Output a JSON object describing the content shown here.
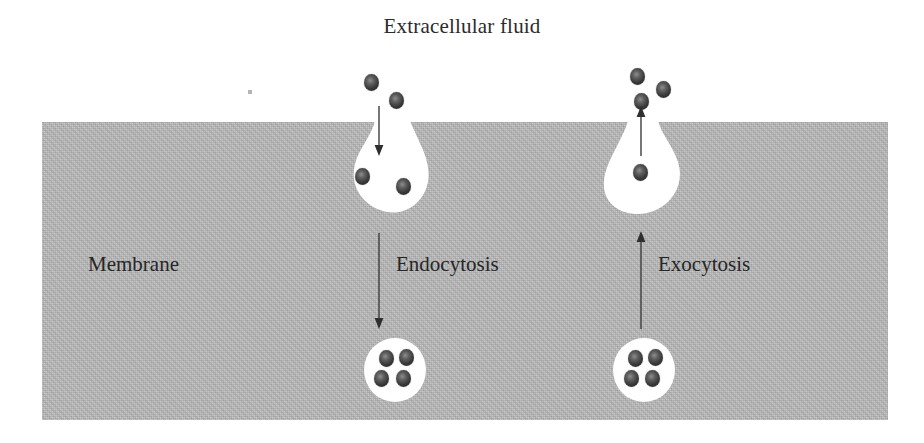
{
  "diagram": {
    "title": "Extracellular fluid",
    "membrane_label": "Membrane",
    "colors": {
      "background": "#ffffff",
      "membrane_fill": "#b4b4b4",
      "pouch_fill": "#ffffff",
      "vesicle_fill": "#ffffff",
      "particle": "#2f2f2f",
      "text": "#262626",
      "arrow": "#3a3a3a"
    },
    "processes": [
      {
        "id": "endocytosis",
        "label": "Endocytosis",
        "direction": "inward",
        "particles_outside": 2,
        "particles_in_pouch": 2,
        "particles_in_vesicle": 4
      },
      {
        "id": "exocytosis",
        "label": "Exocytosis",
        "direction": "outward",
        "particles_outside": 3,
        "particles_in_pouch": 1,
        "particles_in_vesicle": 4
      }
    ],
    "particles": {
      "endocytosis_outside": [
        {
          "x": 364,
          "y": 74
        },
        {
          "x": 389,
          "y": 92
        }
      ],
      "endocytosis_pouch": [
        {
          "x": 355,
          "y": 168
        },
        {
          "x": 396,
          "y": 178
        }
      ],
      "endocytosis_vesicle": [
        {
          "x": 379,
          "y": 350
        },
        {
          "x": 399,
          "y": 349
        },
        {
          "x": 374,
          "y": 370
        },
        {
          "x": 396,
          "y": 370
        }
      ],
      "exocytosis_outside": [
        {
          "x": 630,
          "y": 68
        },
        {
          "x": 656,
          "y": 81
        },
        {
          "x": 634,
          "y": 93
        }
      ],
      "exocytosis_pouch": [
        {
          "x": 633,
          "y": 164
        }
      ],
      "exocytosis_vesicle": [
        {
          "x": 628,
          "y": 350
        },
        {
          "x": 648,
          "y": 349
        },
        {
          "x": 624,
          "y": 370
        },
        {
          "x": 645,
          "y": 370
        }
      ]
    },
    "arrows": [
      {
        "id": "endocytosis-short-arrow",
        "x": 378,
        "y_start": 108,
        "y_end": 152,
        "points": "down"
      },
      {
        "id": "endocytosis-long-arrow",
        "x": 378,
        "y_start": 235,
        "y_end": 327,
        "points": "down"
      },
      {
        "id": "exocytosis-short-arrow",
        "x": 640,
        "y_start": 150,
        "y_end": 108,
        "points": "up"
      },
      {
        "id": "exocytosis-long-arrow",
        "x": 640,
        "y_start": 327,
        "y_end": 233,
        "points": "up"
      }
    ]
  }
}
